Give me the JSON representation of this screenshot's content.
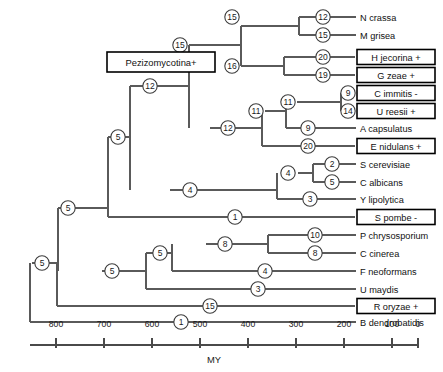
{
  "figure": {
    "type": "phylogenetic-tree",
    "axis_title": "MY",
    "clade_label": "Pezizomycotina+"
  },
  "axis": {
    "title": "MY",
    "ticks": [
      {
        "value": "800",
        "x": 56
      },
      {
        "value": "700",
        "x": 104
      },
      {
        "value": "600",
        "x": 152
      },
      {
        "value": "500",
        "x": 200
      },
      {
        "value": "400",
        "x": 248
      },
      {
        "value": "300",
        "x": 296
      },
      {
        "value": "200",
        "x": 344
      },
      {
        "value": "100",
        "x": 392
      },
      {
        "value": "0",
        "x": 418
      }
    ],
    "line": {
      "x1": 30,
      "x2": 418,
      "y": 345
    },
    "label_y": 327,
    "tick_top": 338,
    "tick_bottom": 348,
    "title_y": 363
  },
  "tips": [
    {
      "name": "N crassa",
      "y": 17,
      "boxed": false,
      "support": "12",
      "support_x": 323,
      "branch_x": 299,
      "label_x": 360
    },
    {
      "name": "M grisea",
      "y": 35,
      "boxed": false,
      "support": "15",
      "support_x": 323,
      "branch_x": 299,
      "label_x": 360
    },
    {
      "name": "H jecorina +",
      "y": 57,
      "boxed": true,
      "support": "20",
      "support_x": 323,
      "branch_x": 284,
      "label_x": 360,
      "box_w": 78,
      "box_h": 15
    },
    {
      "name": "G zeae +",
      "y": 75,
      "boxed": true,
      "support": "19",
      "support_x": 323,
      "branch_x": 284,
      "label_x": 360,
      "box_w": 78,
      "box_h": 15
    },
    {
      "name": "C immitis -",
      "y": 93,
      "boxed": true,
      "support": "9",
      "support_x": 348,
      "branch_x": 341,
      "label_x": 360,
      "box_w": 78,
      "box_h": 15
    },
    {
      "name": "U reesii +",
      "y": 111,
      "boxed": true,
      "support": "14",
      "support_x": 348,
      "branch_x": 341,
      "label_x": 360,
      "box_w": 78,
      "box_h": 15
    },
    {
      "name": "A capsulatus",
      "y": 128,
      "boxed": false,
      "support": "9",
      "support_x": 308,
      "branch_x": 286,
      "label_x": 360
    },
    {
      "name": "E nidulans +",
      "y": 146,
      "boxed": true,
      "support": "20",
      "support_x": 308,
      "branch_x": 262,
      "label_x": 360,
      "box_w": 78,
      "box_h": 15
    },
    {
      "name": "S cerevisiae",
      "y": 164,
      "boxed": false,
      "support": "2",
      "support_x": 332,
      "branch_x": 313,
      "label_x": 360
    },
    {
      "name": "C albicans",
      "y": 182,
      "boxed": false,
      "support": "5",
      "support_x": 332,
      "branch_x": 313,
      "label_x": 360
    },
    {
      "name": "Y lipolytica",
      "y": 199,
      "boxed": false,
      "support": "3",
      "support_x": 310,
      "branch_x": 277,
      "label_x": 360
    },
    {
      "name": "S pombe -",
      "y": 217,
      "boxed": true,
      "support": "1",
      "support_x": 235,
      "branch_x": 108,
      "label_x": 360,
      "box_w": 78,
      "box_h": 15
    },
    {
      "name": "P chrysosporium",
      "y": 235,
      "boxed": false,
      "support": "10",
      "support_x": 315,
      "branch_x": 268,
      "label_x": 360
    },
    {
      "name": "C cinerea",
      "y": 253,
      "boxed": false,
      "support": "8",
      "support_x": 315,
      "branch_x": 268,
      "label_x": 360
    },
    {
      "name": "F neoformans",
      "y": 271,
      "boxed": false,
      "support": "4",
      "support_x": 265,
      "branch_x": 172,
      "label_x": 360
    },
    {
      "name": "R oryzae +",
      "y": 306,
      "boxed": true,
      "support": "15",
      "support_x": 210,
      "branch_x": 57,
      "label_x": 360,
      "box_w": 78,
      "box_h": 15
    },
    {
      "name": "U maydis",
      "y": 289,
      "boxed": false,
      "support": "3",
      "support_x": 258,
      "branch_x": 146,
      "label_x": 360
    },
    {
      "name": "B dendrobatidis",
      "y": 322,
      "boxed": false,
      "support": "1",
      "support_x": 181,
      "branch_x": 30,
      "label_x": 360
    }
  ],
  "internal_nodes": [
    {
      "label": "15",
      "x": 232,
      "y": 17,
      "name": "node-ncrassa-mgrisea"
    },
    {
      "label": "16",
      "x": 232,
      "y": 66,
      "name": "node-hjecorina-gzeae"
    },
    {
      "label": "15",
      "x": 180,
      "y": 45,
      "name": "node-sordariomycetes"
    },
    {
      "label": "11",
      "x": 288,
      "y": 102,
      "name": "node-cimmitis-ureesii"
    },
    {
      "label": "11",
      "x": 256,
      "y": 111,
      "name": "node-onygenales"
    },
    {
      "label": "12",
      "x": 228,
      "y": 128,
      "name": "node-eurotiomycetes"
    },
    {
      "label": "12",
      "x": 150,
      "y": 86,
      "name": "node-pezizomycotina"
    },
    {
      "label": "4",
      "x": 288,
      "y": 173,
      "name": "node-scerevisiae-calbicans"
    },
    {
      "label": "4",
      "x": 190,
      "y": 190,
      "name": "node-saccharomycotina"
    },
    {
      "label": "5",
      "x": 118,
      "y": 137,
      "name": "node-ascomycota-crown"
    },
    {
      "label": "5",
      "x": 68,
      "y": 208,
      "name": "node-ascomycota"
    },
    {
      "label": "8",
      "x": 225,
      "y": 244,
      "name": "node-pchrys-ccinerea"
    },
    {
      "label": "5",
      "x": 160,
      "y": 253,
      "name": "node-agaricomycotina"
    },
    {
      "label": "5",
      "x": 112,
      "y": 271,
      "name": "node-basidiomycota"
    },
    {
      "label": "5",
      "x": 42,
      "y": 263,
      "name": "node-dikarya-root"
    }
  ],
  "clade_box": {
    "label": "Pezizomycotina+",
    "x": 107,
    "y": 52,
    "w": 108,
    "h": 20
  }
}
